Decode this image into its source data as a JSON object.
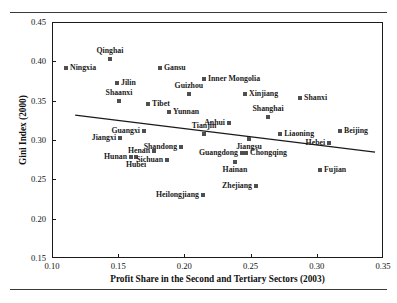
{
  "figure": {
    "title": ""
  },
  "chart_data": {
    "type": "scatter",
    "title": "",
    "xlabel": "Profit Share in the Second and Tertiary Sectors (2003)",
    "ylabel": "Gini Index (2000)",
    "xlim": [
      0.1,
      0.35
    ],
    "ylim": [
      0.15,
      0.45
    ],
    "xticks": [
      "0.10",
      "0.15",
      "0.20",
      "0.25",
      "0.30",
      "0.35"
    ],
    "yticks": [
      "0.15",
      "0.20",
      "0.25",
      "0.30",
      "0.35",
      "0.40",
      "0.45"
    ],
    "grid": false,
    "legend": "none",
    "marker_color": "#4f4f4f",
    "trendline": {
      "type": "linear",
      "x_start": 0.1175,
      "y_start": 0.3315,
      "x_end": 0.344,
      "y_end": 0.2845
    },
    "points": [
      {
        "label": "Qinghai",
        "x": 0.1438,
        "y": 0.4035,
        "label_pos": "above"
      },
      {
        "label": "Ningxia",
        "x": 0.1106,
        "y": 0.392,
        "label_pos": "right"
      },
      {
        "label": "Gansu",
        "x": 0.1816,
        "y": 0.392,
        "label_pos": "right"
      },
      {
        "label": "Inner Mongolia",
        "x": 0.2148,
        "y": 0.378,
        "label_pos": "right"
      },
      {
        "label": "Jilin",
        "x": 0.1491,
        "y": 0.373,
        "label_pos": "right"
      },
      {
        "label": "Guizhou",
        "x": 0.2034,
        "y": 0.359,
        "label_pos": "above"
      },
      {
        "label": "Xinjiang",
        "x": 0.2458,
        "y": 0.359,
        "label_pos": "right"
      },
      {
        "label": "Shanxi",
        "x": 0.2874,
        "y": 0.354,
        "label_pos": "right"
      },
      {
        "label": "Shaanxi",
        "x": 0.1506,
        "y": 0.349,
        "label_pos": "above"
      },
      {
        "label": "Tibet",
        "x": 0.1726,
        "y": 0.346,
        "label_pos": "right"
      },
      {
        "label": "Yunnan",
        "x": 0.1884,
        "y": 0.335,
        "label_pos": "right"
      },
      {
        "label": "Shanghai",
        "x": 0.2632,
        "y": 0.329,
        "label_pos": "above"
      },
      {
        "label": "Anhui",
        "x": 0.2337,
        "y": 0.322,
        "label_pos": "left"
      },
      {
        "label": "Beijing",
        "x": 0.3176,
        "y": 0.312,
        "label_pos": "right"
      },
      {
        "label": "Guangxi",
        "x": 0.1695,
        "y": 0.312,
        "label_pos": "left"
      },
      {
        "label": "Tianjin",
        "x": 0.2148,
        "y": 0.308,
        "label_pos": "above"
      },
      {
        "label": "Liaoning",
        "x": 0.2723,
        "y": 0.308,
        "label_pos": "right"
      },
      {
        "label": "Jiangxi",
        "x": 0.1514,
        "y": 0.302,
        "label_pos": "left"
      },
      {
        "label": "Jiangsu",
        "x": 0.2488,
        "y": 0.301,
        "label_pos": "below"
      },
      {
        "label": "Hebei",
        "x": 0.3093,
        "y": 0.296,
        "label_pos": "left"
      },
      {
        "label": "Shandong",
        "x": 0.1975,
        "y": 0.291,
        "label_pos": "left"
      },
      {
        "label": "Henan",
        "x": 0.1771,
        "y": 0.286,
        "label_pos": "left"
      },
      {
        "label": "Guangdong",
        "x": 0.2435,
        "y": 0.284,
        "label_pos": "left"
      },
      {
        "label": "Chongqing",
        "x": 0.2466,
        "y": 0.284,
        "label_pos": "right"
      },
      {
        "label": "Hunan",
        "x": 0.1597,
        "y": 0.279,
        "label_pos": "left"
      },
      {
        "label": "Hubei",
        "x": 0.1635,
        "y": 0.279,
        "label_pos": "below"
      },
      {
        "label": "Sichuan",
        "x": 0.1869,
        "y": 0.274,
        "label_pos": "left"
      },
      {
        "label": "Hainan",
        "x": 0.2382,
        "y": 0.272,
        "label_pos": "below"
      },
      {
        "label": "Fujian",
        "x": 0.3025,
        "y": 0.262,
        "label_pos": "right"
      },
      {
        "label": "Zhejiang",
        "x": 0.2541,
        "y": 0.241,
        "label_pos": "left"
      },
      {
        "label": "Heilongjiang",
        "x": 0.214,
        "y": 0.23,
        "label_pos": "left"
      }
    ]
  }
}
